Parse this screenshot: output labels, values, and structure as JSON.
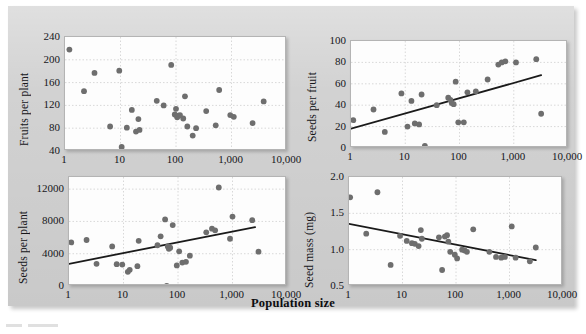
{
  "figure": {
    "xaxis_title": "Population size",
    "plate_color": "#d2d2d2",
    "panel_bg": "#fdfdfd",
    "dot_color": "#6e6e6e",
    "line_color": "#1a1a1a",
    "grid_color": "#d8d8d8"
  },
  "chart_data": [
    {
      "id": "fruits-per-plant",
      "type": "scatter",
      "title": "",
      "xlabel": "Population size",
      "ylabel": "Fruits per plant",
      "xscale": "log",
      "xlim": [
        1,
        10000
      ],
      "ylim": [
        40,
        240
      ],
      "xticks": [
        1,
        10,
        100,
        1000,
        10000
      ],
      "xticklabels": [
        "1",
        "10",
        "100",
        "1,000",
        "10,000"
      ],
      "yticks": [
        40,
        80,
        120,
        160,
        200,
        240
      ],
      "yticklabels": [
        "40",
        "80",
        "120",
        "160",
        "200",
        "240"
      ],
      "grid": true,
      "trendline": null,
      "points": [
        [
          1.2,
          218
        ],
        [
          2.2,
          145
        ],
        [
          3.4,
          177
        ],
        [
          9.5,
          181
        ],
        [
          10.5,
          47
        ],
        [
          6.5,
          83
        ],
        [
          13,
          81
        ],
        [
          16,
          112
        ],
        [
          19,
          74
        ],
        [
          21,
          96
        ],
        [
          22,
          77
        ],
        [
          45,
          128
        ],
        [
          60,
          120
        ],
        [
          82,
          191
        ],
        [
          95,
          104
        ],
        [
          100,
          114
        ],
        [
          105,
          99
        ],
        [
          110,
          102
        ],
        [
          118,
          103
        ],
        [
          135,
          97
        ],
        [
          145,
          136
        ],
        [
          160,
          83
        ],
        [
          200,
          67
        ],
        [
          230,
          80
        ],
        [
          350,
          110
        ],
        [
          520,
          85
        ],
        [
          600,
          147
        ],
        [
          950,
          103
        ],
        [
          1100,
          100
        ],
        [
          2400,
          89
        ],
        [
          3800,
          127
        ]
      ]
    },
    {
      "id": "seeds-per-fruit",
      "type": "scatter",
      "title": "",
      "xlabel": "Population size",
      "ylabel": "Seeds per fruit",
      "xscale": "log",
      "xlim": [
        1,
        10000
      ],
      "ylim": [
        0,
        100
      ],
      "xticks": [
        1,
        10,
        100,
        1000,
        10000
      ],
      "xticklabels": [
        "1",
        "10",
        "100",
        "1,000",
        "10,000"
      ],
      "yticks": [
        0,
        20,
        40,
        60,
        80,
        100
      ],
      "yticklabels": [
        "0",
        "20",
        "40",
        "60",
        "80",
        "100"
      ],
      "grid": true,
      "trendline": {
        "x": [
          1,
          3200
        ],
        "y": [
          18,
          68
        ],
        "style": "solid"
      },
      "points": [
        [
          1.1,
          26
        ],
        [
          2.6,
          36
        ],
        [
          4.2,
          15
        ],
        [
          8.5,
          51
        ],
        [
          11,
          20
        ],
        [
          13,
          44
        ],
        [
          15,
          23
        ],
        [
          18,
          22
        ],
        [
          20,
          50
        ],
        [
          23,
          2
        ],
        [
          38,
          40
        ],
        [
          62,
          47
        ],
        [
          68,
          45
        ],
        [
          72,
          42
        ],
        [
          78,
          41
        ],
        [
          85,
          62
        ],
        [
          95,
          24
        ],
        [
          120,
          24
        ],
        [
          140,
          52
        ],
        [
          200,
          53
        ],
        [
          330,
          64
        ],
        [
          520,
          78
        ],
        [
          600,
          80
        ],
        [
          700,
          81
        ],
        [
          1100,
          80
        ],
        [
          2600,
          83
        ],
        [
          3200,
          32
        ]
      ]
    },
    {
      "id": "seeds-per-plant",
      "type": "scatter",
      "title": "",
      "xlabel": "Population size",
      "ylabel": "Seeds per plant",
      "xscale": "log",
      "xlim": [
        1,
        10000
      ],
      "ylim": [
        0,
        13500
      ],
      "xticks": [
        1,
        10,
        100,
        1000,
        10000
      ],
      "xticklabels": [
        "1",
        "10",
        "100",
        "1,000",
        "10,000"
      ],
      "yticks": [
        0,
        4000,
        8000,
        12000
      ],
      "yticklabels": [
        "0",
        "4000",
        "8000",
        "12000"
      ],
      "grid": true,
      "trendline": {
        "x": [
          1,
          2600
        ],
        "y": [
          2750,
          7300
        ],
        "style": "solid"
      },
      "points": [
        [
          1.1,
          5400
        ],
        [
          2.1,
          5700
        ],
        [
          3.2,
          2750
        ],
        [
          6.2,
          4900
        ],
        [
          7.5,
          2700
        ],
        [
          9.5,
          2650
        ],
        [
          12,
          1750
        ],
        [
          13,
          2000
        ],
        [
          18,
          2450
        ],
        [
          19,
          5600
        ],
        [
          42,
          5050
        ],
        [
          48,
          6150
        ],
        [
          58,
          8250
        ],
        [
          62,
          11
        ],
        [
          65,
          4900
        ],
        [
          68,
          4600
        ],
        [
          72,
          4750
        ],
        [
          80,
          7550
        ],
        [
          95,
          2550
        ],
        [
          105,
          4300
        ],
        [
          120,
          2900
        ],
        [
          140,
          3000
        ],
        [
          165,
          3750
        ],
        [
          330,
          6650
        ],
        [
          420,
          7100
        ],
        [
          480,
          6900
        ],
        [
          560,
          12200
        ],
        [
          900,
          5850
        ],
        [
          1000,
          8600
        ],
        [
          2300,
          8150
        ],
        [
          3000,
          4250
        ]
      ]
    },
    {
      "id": "seed-mass",
      "type": "scatter",
      "title": "",
      "xlabel": "Population size",
      "ylabel": "Seed mass (mg)",
      "xscale": "log",
      "xlim": [
        1,
        10000
      ],
      "ylim": [
        0.5,
        2.0
      ],
      "xticks": [
        1,
        10,
        100,
        1000,
        10000
      ],
      "xticklabels": [
        "1",
        "10",
        "100",
        "1,000",
        "10,000"
      ],
      "yticks": [
        0.5,
        1.0,
        1.5,
        2.0
      ],
      "yticklabels": [
        "0.5",
        "1.0",
        "1.5",
        "2.0"
      ],
      "grid": true,
      "trendline": {
        "x": [
          1,
          3100
        ],
        "y": [
          1.355,
          0.855
        ],
        "style": "solid"
      },
      "points": [
        [
          1.05,
          1.72
        ],
        [
          2.1,
          1.22
        ],
        [
          3.4,
          1.79
        ],
        [
          6.0,
          0.79
        ],
        [
          9.0,
          1.19
        ],
        [
          12,
          1.12
        ],
        [
          15,
          1.09
        ],
        [
          17,
          1.08
        ],
        [
          20,
          1.05
        ],
        [
          22,
          1.27
        ],
        [
          23,
          1.15
        ],
        [
          48,
          1.17
        ],
        [
          55,
          0.72
        ],
        [
          62,
          1.18
        ],
        [
          68,
          1.2
        ],
        [
          72,
          1.11
        ],
        [
          78,
          0.97
        ],
        [
          95,
          0.93
        ],
        [
          105,
          0.88
        ],
        [
          130,
          1.0
        ],
        [
          145,
          0.99
        ],
        [
          160,
          0.97
        ],
        [
          210,
          1.28
        ],
        [
          420,
          0.97
        ],
        [
          560,
          0.9
        ],
        [
          700,
          0.89
        ],
        [
          820,
          0.9
        ],
        [
          1100,
          1.32
        ],
        [
          1300,
          0.89
        ],
        [
          2400,
          0.84
        ],
        [
          3100,
          1.03
        ]
      ]
    }
  ]
}
